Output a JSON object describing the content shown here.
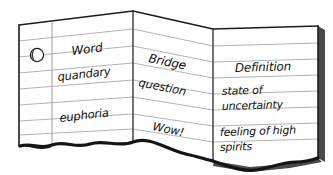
{
  "illustration": {
    "subject": "torn folded ruled notebook paper with vocabulary table",
    "alt_label": "Vocabulary chart on folded notebook paper"
  },
  "paper": {
    "hole_punch": "hole-punch",
    "background_color": "#ffffff",
    "paper_color": "#ffffff",
    "rule_line_color": "#b4b4b4",
    "ink_color": "#111111",
    "edge_color": "#1c1c1c",
    "shadow_color": "#4a4a4a"
  },
  "table": {
    "headers": [
      {
        "id": "word",
        "label": "Word"
      },
      {
        "id": "bridge",
        "label": "Bridge"
      },
      {
        "id": "definition",
        "label": "Definition"
      }
    ],
    "rows": [
      {
        "word": "quandary",
        "bridge": "question",
        "definition_line1": "state of",
        "definition_line2": "uncertainty"
      },
      {
        "word": "euphoria",
        "bridge": "Wow!",
        "definition_line1": "feeling of high",
        "definition_line2": "spirits"
      }
    ]
  }
}
